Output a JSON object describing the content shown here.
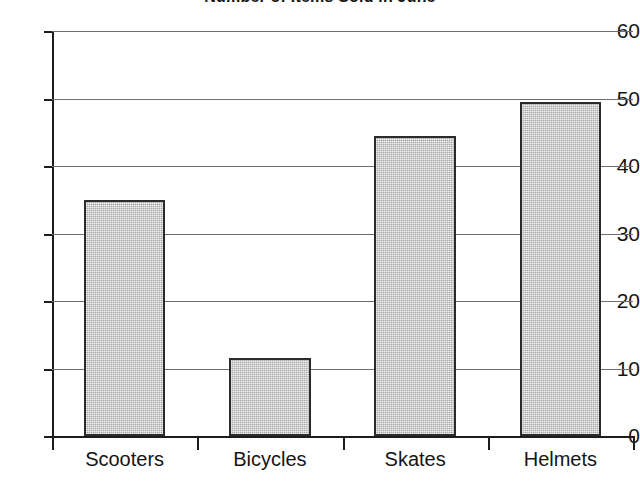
{
  "chart_data": {
    "type": "bar",
    "title": "Number of Items Sold in June",
    "xlabel": "",
    "ylabel": "",
    "categories": [
      "Scooters",
      "Bicycles",
      "Skates",
      "Helmets"
    ],
    "values": [
      35,
      11.5,
      44.5,
      49.5
    ],
    "ylim": [
      0,
      60
    ],
    "yticks": [
      0,
      10,
      20,
      30,
      40,
      50,
      60
    ],
    "ytick_labels": [
      "0",
      "10",
      "20",
      "30",
      "40",
      "50",
      "60"
    ],
    "grid": true,
    "legend": false,
    "legend_position": "none",
    "bar_fill_color": "#a9a9a9",
    "bar_edge_color": "#2b2b2b",
    "gridline_color": "#6f6f6f",
    "axis_color": "#1c1c1c",
    "background_color": "#ffffff"
  }
}
